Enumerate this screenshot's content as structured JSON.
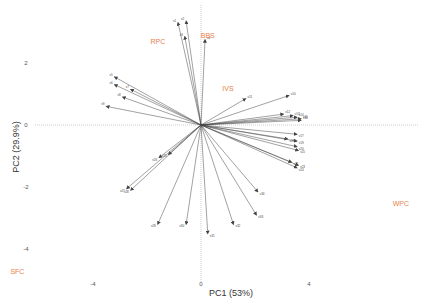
{
  "chart_data": {
    "type": "scatter",
    "subtype": "pca-biplot",
    "title": "",
    "xlabel": "PC1 (53%)",
    "ylabel": "PC2 (29.9%)",
    "xlim": [
      -5.4,
      8.2
    ],
    "ylim": [
      -5.8,
      4.0
    ],
    "x_ticks": [
      -4,
      0,
      4
    ],
    "y_ticks": [
      2,
      0,
      -2,
      -4
    ],
    "x_tick_labels": [
      "-4",
      "0",
      "4"
    ],
    "y_tick_labels": [
      "2",
      "0",
      "-2",
      "-4"
    ],
    "zero_lines": true,
    "grid": false,
    "legend": "none",
    "groups": [
      {
        "name": "RPC",
        "x": -1.6,
        "y": 2.6
      },
      {
        "name": "BBS",
        "x": 0.25,
        "y": 2.8
      },
      {
        "name": "IVS",
        "x": 1.0,
        "y": 1.1
      },
      {
        "name": "WPC",
        "x": 7.4,
        "y": -2.6
      },
      {
        "name": "SFC",
        "x": -6.8,
        "y": -4.8
      }
    ],
    "loadings_note": "Variable arrow labels are too small to read in the screenshot, so they are shown as placeholders.",
    "loadings": [
      {
        "name": "v1",
        "x": -0.85,
        "y": 3.3
      },
      {
        "name": "v2",
        "x": -0.55,
        "y": 3.35
      },
      {
        "name": "v3",
        "x": -0.6,
        "y": 2.85
      },
      {
        "name": "v4",
        "x": 0.15,
        "y": 2.75
      },
      {
        "name": "v5",
        "x": -3.2,
        "y": 1.55
      },
      {
        "name": "v6",
        "x": -3.2,
        "y": 1.3
      },
      {
        "name": "v7",
        "x": -2.6,
        "y": 1.15
      },
      {
        "name": "v8",
        "x": -2.9,
        "y": 0.9
      },
      {
        "name": "v9",
        "x": -3.5,
        "y": 0.6
      },
      {
        "name": "v10",
        "x": 3.25,
        "y": 0.95
      },
      {
        "name": "v11",
        "x": 1.65,
        "y": 0.85
      },
      {
        "name": "v12",
        "x": 3.05,
        "y": 0.35
      },
      {
        "name": "v13",
        "x": 3.4,
        "y": 0.3
      },
      {
        "name": "v14",
        "x": 3.55,
        "y": 0.25
      },
      {
        "name": "v15",
        "x": 3.7,
        "y": 0.2
      },
      {
        "name": "v16",
        "x": 3.7,
        "y": 0.15
      },
      {
        "name": "v17",
        "x": 3.55,
        "y": -0.3
      },
      {
        "name": "v18",
        "x": 3.2,
        "y": -0.45
      },
      {
        "name": "v19",
        "x": 3.55,
        "y": -0.52
      },
      {
        "name": "v20",
        "x": 3.55,
        "y": -0.7
      },
      {
        "name": "v21",
        "x": 3.6,
        "y": -0.82
      },
      {
        "name": "v22",
        "x": 3.35,
        "y": -1.2
      },
      {
        "name": "v23",
        "x": 3.6,
        "y": -1.3
      },
      {
        "name": "v24",
        "x": 3.55,
        "y": -1.38
      },
      {
        "name": "v25",
        "x": -1.2,
        "y": -0.95
      },
      {
        "name": "v26",
        "x": -1.55,
        "y": -1.05
      },
      {
        "name": "v27",
        "x": -2.75,
        "y": -2.05
      },
      {
        "name": "v28",
        "x": -2.6,
        "y": -2.1
      },
      {
        "name": "v29",
        "x": -1.6,
        "y": -3.2
      },
      {
        "name": "v30",
        "x": -0.55,
        "y": -3.2
      },
      {
        "name": "v31",
        "x": 0.25,
        "y": -3.5
      },
      {
        "name": "v32",
        "x": 1.2,
        "y": -3.2
      },
      {
        "name": "v33",
        "x": 2.05,
        "y": -2.9
      },
      {
        "name": "v34",
        "x": 2.1,
        "y": -2.15
      }
    ]
  }
}
